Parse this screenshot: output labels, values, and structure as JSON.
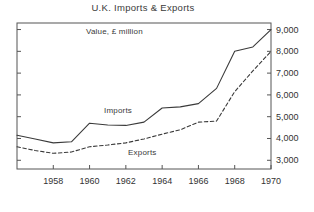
{
  "chart_data": {
    "type": "line",
    "title": "U.K. Imports & Exports",
    "subtitle": "Value, £ million",
    "xlabel": "",
    "ylabel": "",
    "xlim": [
      1956,
      1970
    ],
    "ylim": [
      2600,
      9300
    ],
    "grid": false,
    "legend_position": "inline-annotation",
    "xticks": [
      1958,
      1960,
      1962,
      1964,
      1966,
      1968,
      1970
    ],
    "xtick_labels": [
      "1958",
      "1960",
      "1962",
      "1964",
      "1966",
      "1968",
      "1970"
    ],
    "yticks": [
      3000,
      4000,
      5000,
      6000,
      7000,
      8000,
      9000
    ],
    "ytick_labels": [
      "3,000",
      "4,000",
      "5,000",
      "6,000",
      "7,000",
      "8,000",
      "9,000"
    ],
    "x": [
      1956,
      1957,
      1958,
      1959,
      1960,
      1961,
      1962,
      1963,
      1964,
      1965,
      1966,
      1967,
      1968,
      1969,
      1970
    ],
    "series": [
      {
        "name": "Imports",
        "style": "solid",
        "color": "#3a3a3a",
        "values": [
          4150,
          3980,
          3800,
          3850,
          4700,
          4620,
          4600,
          4750,
          5400,
          5450,
          5600,
          6300,
          8000,
          8200,
          9000
        ]
      },
      {
        "name": "Exports",
        "style": "dashed",
        "color": "#3a3a3a",
        "values": [
          3620,
          3450,
          3320,
          3380,
          3620,
          3700,
          3800,
          3980,
          4200,
          4400,
          4750,
          4800,
          6150,
          7100,
          8000
        ]
      }
    ],
    "annotations": [
      {
        "text": "Imports",
        "x": 1961.2,
        "y": 5750
      },
      {
        "text": "Exports",
        "x": 1963.0,
        "y": 3300
      },
      {
        "text": "Value, £ million",
        "x": 1960.4,
        "y": 8900
      }
    ]
  },
  "axis": {
    "frame_color": "#555555",
    "tick_color": "#555555",
    "text_color": "#333333"
  }
}
